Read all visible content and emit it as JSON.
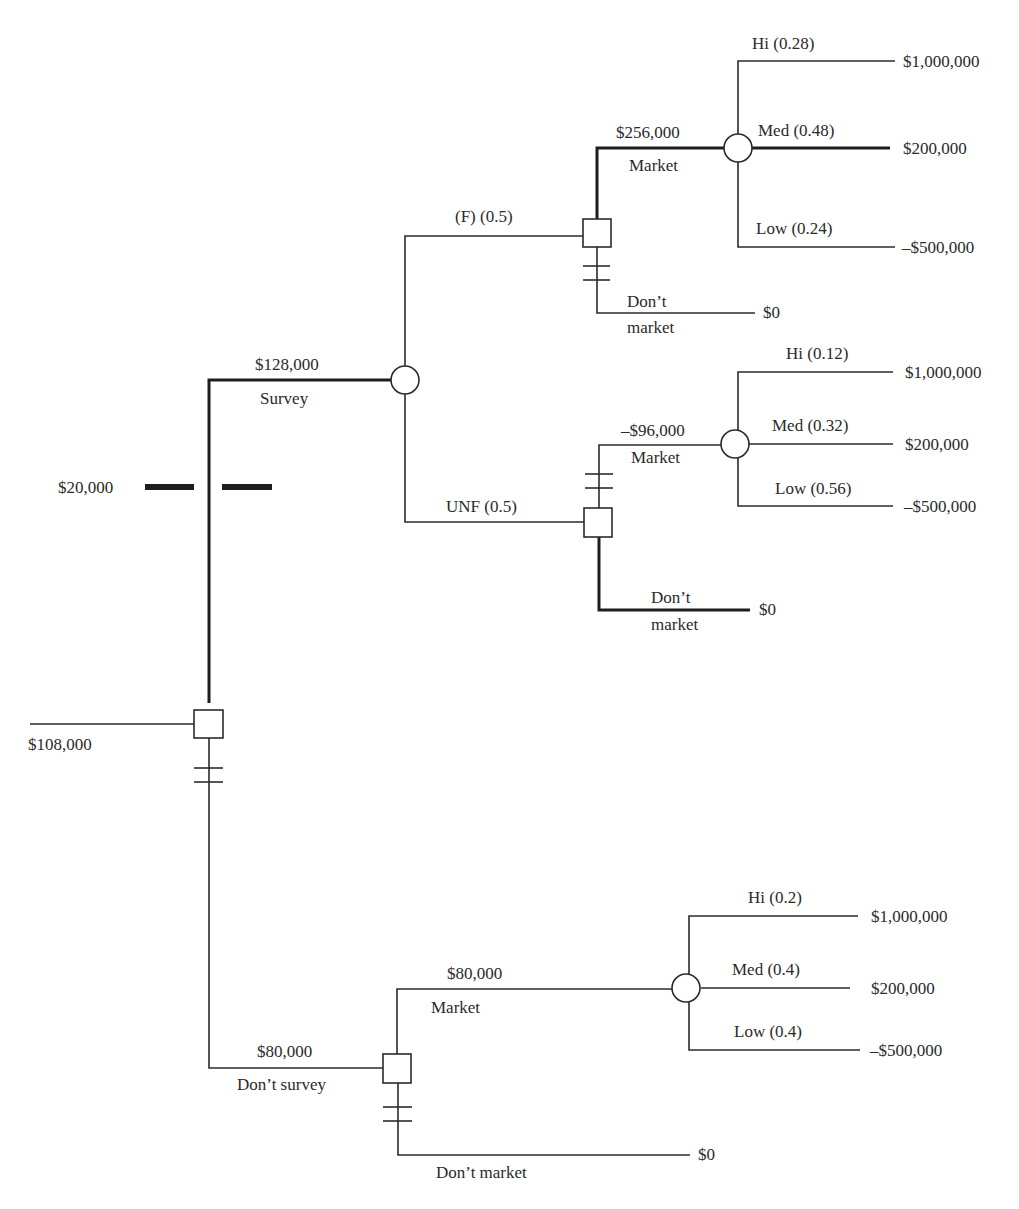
{
  "root": {
    "value": "$108,000"
  },
  "toll": {
    "label": "$20,000"
  },
  "survey": {
    "label": "Survey",
    "value": "$128,000",
    "favorable": {
      "label": "(F) (0.5)",
      "market": {
        "label": "Market",
        "value": "$256,000",
        "outcomes": [
          {
            "label": "Hi (0.28)",
            "payoff": "$1,000,000"
          },
          {
            "label": "Med (0.48)",
            "payoff": "$200,000"
          },
          {
            "label": "Low (0.24)",
            "payoff": "–$500,000"
          }
        ]
      },
      "dont_market": {
        "label_line1": "Don’t",
        "label_line2": "market",
        "payoff": "$0"
      }
    },
    "unfavorable": {
      "label": "UNF (0.5)",
      "market": {
        "label": "Market",
        "value": "–$96,000",
        "outcomes": [
          {
            "label": "Hi (0.12)",
            "payoff": "$1,000,000"
          },
          {
            "label": "Med (0.32)",
            "payoff": "$200,000"
          },
          {
            "label": "Low (0.56)",
            "payoff": "–$500,000"
          }
        ]
      },
      "dont_market": {
        "label_line1": "Don’t",
        "label_line2": "market",
        "payoff": "$0"
      }
    }
  },
  "dont_survey": {
    "label": "Don’t survey",
    "value": "$80,000",
    "market": {
      "label": "Market",
      "value": "$80,000",
      "outcomes": [
        {
          "label": "Hi (0.2)",
          "payoff": "$1,000,000"
        },
        {
          "label": "Med (0.4)",
          "payoff": "$200,000"
        },
        {
          "label": "Low (0.4)",
          "payoff": "–$500,000"
        }
      ]
    },
    "dont_market": {
      "label": "Don’t market",
      "payoff": "$0"
    }
  }
}
